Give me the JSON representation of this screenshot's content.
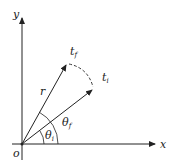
{
  "diagram": {
    "axes": {
      "x_label": "x",
      "y_label": "y",
      "origin_label": "o"
    },
    "vectors": [
      {
        "name": "t_f",
        "label": "t",
        "sub": "f"
      },
      {
        "name": "t_i",
        "label": "t",
        "sub": "i"
      }
    ],
    "radius_label": "r",
    "angles": [
      {
        "label": "θ",
        "sub": "i"
      },
      {
        "label": "θ",
        "sub": "f"
      }
    ],
    "colors": {
      "stroke": "#222222"
    }
  }
}
